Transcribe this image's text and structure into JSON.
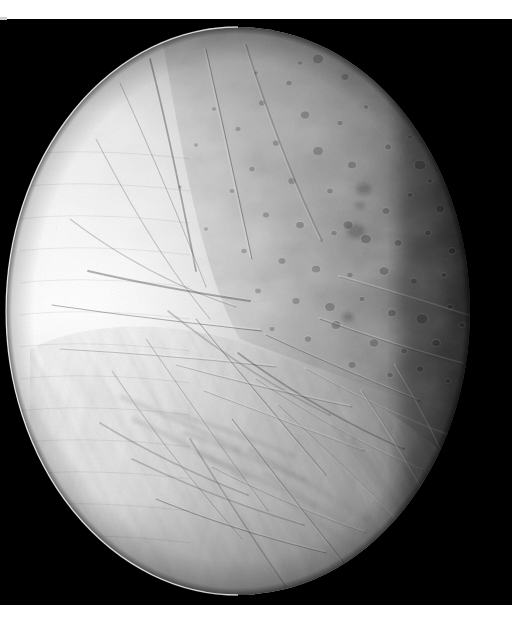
{
  "image": {
    "subject": "enceladus",
    "body_type": "icy moon",
    "capture": "grayscale spacecraft flyby image",
    "alt_text": "Black-and-white spacecraft photograph of Saturn's icy moon Enceladus, brightly lit from the left, showing heavily cratered terrain in the north and complex grooved, ridged fracture terrain toward the south polar region.",
    "width_px": 523,
    "height_px": 620
  },
  "canvas": {
    "paper_color": "#ffffff",
    "space_color": "#000000",
    "frame": {
      "left": 0,
      "top": 19,
      "width": 512,
      "height": 586
    }
  },
  "palette": {
    "space_black": "#000000",
    "limb_white": "#fdfdfd",
    "bright_ice": "#f2f2f2",
    "mid_gray": "#b8b8b8",
    "shadow_gray": "#6e6e6e",
    "terminator_dark": "#141414",
    "crater_rim_light": "#d8d8d8",
    "crater_floor_dark": "#8a8a8a",
    "paper_white": "#ffffff"
  },
  "lighting": {
    "source_direction": "left",
    "bright_limb_side": "west",
    "terminator_side": "east",
    "phase": "gibbous"
  },
  "disc": {
    "center_x": 238,
    "center_y": 292,
    "radius_x": 232,
    "radius_y": 284
  },
  "regions": [
    {
      "name": "bright-limb",
      "label": "Sunlit western limb",
      "tone": "#fbfbfb"
    },
    {
      "name": "cratered-plains",
      "label": "Northern cratered plains",
      "tone": "#b4b4b4"
    },
    {
      "name": "grooved-terrain",
      "label": "Southern grooved terrain",
      "tone": "#a8a8a8"
    },
    {
      "name": "fracture-belt",
      "label": "Equatorial fracture belt",
      "tone": "#c2c2c2"
    },
    {
      "name": "terminator",
      "label": "Eastern terminator",
      "tone": "#101010"
    }
  ],
  "craters": [
    {
      "cx": 318,
      "cy": 40,
      "r": 5.5
    },
    {
      "cx": 345,
      "cy": 58,
      "r": 4.0
    },
    {
      "cx": 289,
      "cy": 64,
      "r": 3.0
    },
    {
      "cx": 372,
      "cy": 48,
      "r": 3.2
    },
    {
      "cx": 398,
      "cy": 70,
      "r": 5.0
    },
    {
      "cx": 262,
      "cy": 84,
      "r": 3.4
    },
    {
      "cx": 305,
      "cy": 96,
      "r": 4.6
    },
    {
      "cx": 340,
      "cy": 104,
      "r": 3.0
    },
    {
      "cx": 366,
      "cy": 88,
      "r": 2.6
    },
    {
      "cx": 414,
      "cy": 100,
      "r": 4.2
    },
    {
      "cx": 434,
      "cy": 82,
      "r": 3.0
    },
    {
      "cx": 238,
      "cy": 110,
      "r": 2.8
    },
    {
      "cx": 276,
      "cy": 124,
      "r": 3.6
    },
    {
      "cx": 318,
      "cy": 132,
      "r": 5.2
    },
    {
      "cx": 352,
      "cy": 146,
      "r": 4.4
    },
    {
      "cx": 388,
      "cy": 128,
      "r": 3.4
    },
    {
      "cx": 420,
      "cy": 146,
      "r": 5.8
    },
    {
      "cx": 446,
      "cy": 126,
      "r": 3.2
    },
    {
      "cx": 252,
      "cy": 150,
      "r": 3.0
    },
    {
      "cx": 292,
      "cy": 162,
      "r": 4.0
    },
    {
      "cx": 330,
      "cy": 172,
      "r": 3.2
    },
    {
      "cx": 364,
      "cy": 170,
      "r": 9.5
    },
    {
      "cx": 360,
      "cy": 186,
      "r": 6.5
    },
    {
      "cx": 386,
      "cy": 192,
      "r": 4.0
    },
    {
      "cx": 410,
      "cy": 176,
      "r": 3.0
    },
    {
      "cx": 440,
      "cy": 190,
      "r": 4.6
    },
    {
      "cx": 266,
      "cy": 196,
      "r": 3.4
    },
    {
      "cx": 300,
      "cy": 206,
      "r": 4.2
    },
    {
      "cx": 334,
      "cy": 214,
      "r": 3.0
    },
    {
      "cx": 356,
      "cy": 212,
      "r": 11.0
    },
    {
      "cx": 348,
      "cy": 206,
      "r": 5.0
    },
    {
      "cx": 366,
      "cy": 220,
      "r": 5.5
    },
    {
      "cx": 398,
      "cy": 224,
      "r": 4.0
    },
    {
      "cx": 428,
      "cy": 214,
      "r": 3.4
    },
    {
      "cx": 452,
      "cy": 232,
      "r": 4.0
    },
    {
      "cx": 244,
      "cy": 232,
      "r": 3.0
    },
    {
      "cx": 282,
      "cy": 242,
      "r": 3.8
    },
    {
      "cx": 316,
      "cy": 250,
      "r": 4.4
    },
    {
      "cx": 350,
      "cy": 256,
      "r": 3.2
    },
    {
      "cx": 384,
      "cy": 252,
      "r": 5.0
    },
    {
      "cx": 414,
      "cy": 262,
      "r": 3.6
    },
    {
      "cx": 444,
      "cy": 256,
      "r": 3.0
    },
    {
      "cx": 258,
      "cy": 272,
      "r": 3.2
    },
    {
      "cx": 296,
      "cy": 282,
      "r": 4.0
    },
    {
      "cx": 330,
      "cy": 288,
      "r": 5.2
    },
    {
      "cx": 362,
      "cy": 280,
      "r": 3.0
    },
    {
      "cx": 348,
      "cy": 298,
      "r": 8.0
    },
    {
      "cx": 336,
      "cy": 306,
      "r": 5.0
    },
    {
      "cx": 392,
      "cy": 294,
      "r": 4.4
    },
    {
      "cx": 422,
      "cy": 300,
      "r": 6.0
    },
    {
      "cx": 450,
      "cy": 288,
      "r": 3.2
    },
    {
      "cx": 272,
      "cy": 310,
      "r": 2.8
    },
    {
      "cx": 308,
      "cy": 320,
      "r": 3.6
    },
    {
      "cx": 374,
      "cy": 324,
      "r": 4.8
    },
    {
      "cx": 404,
      "cy": 332,
      "r": 3.4
    },
    {
      "cx": 436,
      "cy": 324,
      "r": 4.2
    },
    {
      "cx": 462,
      "cy": 306,
      "r": 3.0
    },
    {
      "cx": 352,
      "cy": 346,
      "r": 4.0
    },
    {
      "cx": 390,
      "cy": 356,
      "r": 3.2
    },
    {
      "cx": 420,
      "cy": 350,
      "r": 3.8
    },
    {
      "cx": 448,
      "cy": 362,
      "r": 3.0
    },
    {
      "cx": 214,
      "cy": 90,
      "r": 2.4
    },
    {
      "cx": 196,
      "cy": 126,
      "r": 2.2
    },
    {
      "cx": 232,
      "cy": 172,
      "r": 2.6
    },
    {
      "cx": 206,
      "cy": 210,
      "r": 2.2
    },
    {
      "cx": 180,
      "cy": 168,
      "r": 2.0
    },
    {
      "cx": 300,
      "cy": 44,
      "r": 2.4
    },
    {
      "cx": 256,
      "cy": 54,
      "r": 2.2
    },
    {
      "cx": 430,
      "cy": 162,
      "r": 2.6
    },
    {
      "cx": 456,
      "cy": 170,
      "r": 2.2
    },
    {
      "cx": 410,
      "cy": 118,
      "r": 2.4
    }
  ],
  "fractures": [
    "M 150 40 C 168 110, 182 180, 196 252",
    "M 120 64 C 150 130, 178 196, 206 268",
    "M 96 120 C 132 190, 168 250, 210 300",
    "M 206 30 C 222 100, 236 168, 252 240",
    "M 246 26 C 268 96, 292 160, 322 222",
    "M 70 200 C 120 238, 176 268, 236 288",
    "M 52 286 C 118 296, 190 304, 262 312",
    "M 60 330 C 130 334, 204 340, 276 348",
    "M 168 292 C 216 330, 268 366, 330 396",
    "M 196 300 C 238 352, 282 404, 326 456",
    "M 146 320 C 186 378, 226 436, 268 492",
    "M 112 352 C 152 412, 196 468, 242 520",
    "M 238 334 C 290 372, 344 404, 404 430",
    "M 256 360 C 310 396, 366 428, 424 452",
    "M 278 386 C 324 428, 368 470, 410 512",
    "M 232 400 C 270 450, 308 498, 344 544",
    "M 190 420 C 222 472, 254 522, 286 568",
    "M 306 350 C 354 376, 402 400, 452 418",
    "M 320 300 C 370 318, 420 334, 466 346",
    "M 340 258 C 388 272, 434 286, 472 298",
    "M 132 440 C 186 466, 244 488, 304 506",
    "M 156 480 C 210 502, 268 520, 326 534",
    "M 362 372 C 392 416, 420 462, 444 508",
    "M 396 346 C 422 388, 444 432, 462 476",
    "M 88 252 C 140 264, 196 274, 250 282",
    "M 176 346 C 234 362, 294 376, 352 388",
    "M 204 372 C 258 392, 312 412, 364 432",
    "M 266 316 C 318 340, 370 362, 420 382",
    "M 100 404 C 146 432, 196 456, 248 476",
    "M 212 448 C 262 474, 314 496, 366 514"
  ],
  "ridges": [
    "M 170 392 C 210 404, 252 418, 292 436",
    "M 182 412 C 224 426, 264 442, 304 460",
    "M 194 432 C 236 448, 276 466, 314 486",
    "M 246 428 C 288 450, 328 474, 366 500",
    "M 262 452 C 302 476, 340 500, 376 526",
    "M 278 476 C 314 500, 350 524, 384 550",
    "M 330 404 C 360 440, 386 478, 408 518",
    "M 348 418 C 376 454, 400 492, 420 532",
    "M 118 376 C 160 392, 200 410, 238 430",
    "M 130 398 C 170 416, 208 436, 244 458"
  ],
  "striations": {
    "count": 26,
    "description": "fine parallel scan striations across the bright western limb"
  }
}
